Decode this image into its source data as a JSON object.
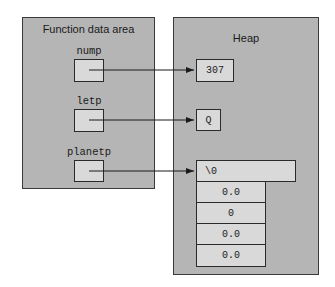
{
  "function_area": {
    "title": "Function data area",
    "variables": [
      {
        "name": "nump"
      },
      {
        "name": "letp"
      },
      {
        "name": "planetp"
      }
    ]
  },
  "heap": {
    "title": "Heap",
    "nump_target": "307",
    "letp_target": "Q",
    "planetp_target": {
      "header": "\\0",
      "cells": [
        "0.0",
        "0",
        "0.0",
        "0.0"
      ]
    }
  },
  "colors": {
    "panel": "#b5b5b5",
    "cell": "#d9d9d9",
    "border": "#2a2a2a"
  }
}
